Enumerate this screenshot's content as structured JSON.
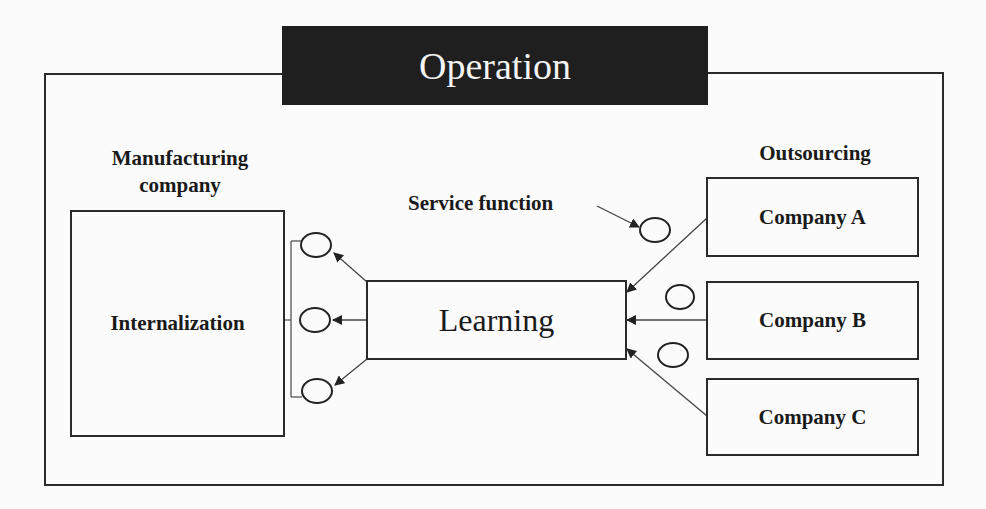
{
  "diagram": {
    "title": "Operation",
    "left_section": {
      "heading": "Manufacturing company",
      "heading_line1": "Manufacturing",
      "heading_line2": "company",
      "box_label": "Internalization"
    },
    "center": {
      "box_label": "Learning",
      "annotation": "Service function"
    },
    "right_section": {
      "heading": "Outsourcing",
      "companies": [
        {
          "label": "Company A"
        },
        {
          "label": "Company B"
        },
        {
          "label": "Company C"
        }
      ]
    },
    "colors": {
      "banner_bg": "#1f1f1f",
      "banner_text": "#f4f4f4",
      "line": "#2a2a2a",
      "background": "#fbfbfb"
    }
  }
}
